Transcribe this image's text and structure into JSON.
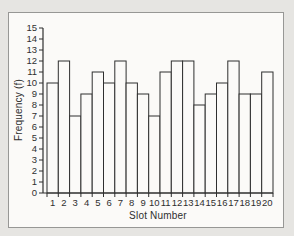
{
  "chart_data": {
    "type": "bar",
    "title": "",
    "xlabel": "Slot Number",
    "ylabel": "Frequency (f)",
    "categories": [
      "1",
      "2",
      "3",
      "4",
      "5",
      "6",
      "7",
      "8",
      "9",
      "10",
      "11",
      "12",
      "13",
      "14",
      "15",
      "16",
      "17",
      "18",
      "19",
      "20"
    ],
    "values": [
      10,
      12,
      7,
      9,
      11,
      10,
      12,
      10,
      9,
      7,
      11,
      12,
      12,
      8,
      9,
      10,
      12,
      9,
      9,
      11
    ],
    "ylim": [
      0,
      15
    ],
    "ytick_step": 1,
    "grid": false,
    "legend": "none",
    "bar_style": "outline",
    "bar_fill": "#fbfaf8",
    "line_color": "#2f2f2f"
  },
  "frame": {
    "background": "#fbfaf8",
    "border_color": "#979795",
    "page_background": "#e6e5e2"
  }
}
